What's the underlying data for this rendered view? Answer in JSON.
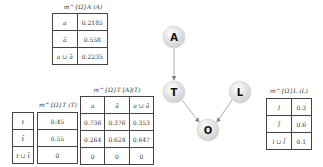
{
  "tables": {
    "mA": {
      "caption": "m^{Ω}A (A)",
      "rows": [
        {
          "label": "a",
          "value": "0.2185"
        },
        {
          "label": "ā",
          "value": "0.558"
        },
        {
          "label": "a ∪ ā",
          "value": "0.2235"
        }
      ]
    },
    "T_labels": [
      "t",
      "t̄",
      "t ∪ t̄"
    ],
    "mT": {
      "caption": "m^{Ω}T (T)",
      "values": [
        "0.45",
        "0.55",
        "0"
      ]
    },
    "mTA": {
      "caption": "m^{Ω}T [A](T)",
      "headers": [
        "a",
        "ā",
        "a ∪ ā"
      ],
      "rows": [
        [
          "0.736",
          "0.376",
          "0.353"
        ],
        [
          "0.264",
          "0.624",
          "0.647"
        ],
        [
          "0",
          "0",
          "0"
        ]
      ]
    },
    "mL": {
      "caption": "m^{Ω}L (L)",
      "rows": [
        {
          "label": "l",
          "value": "0.3"
        },
        {
          "label": "l̄",
          "value": "0.6"
        },
        {
          "label": "l ∪ l̄",
          "value": "0.1"
        }
      ]
    }
  },
  "graph": {
    "nodes": [
      {
        "id": "A",
        "label": "A",
        "x": 174,
        "y": 37
      },
      {
        "id": "T",
        "label": "T",
        "x": 174,
        "y": 92
      },
      {
        "id": "L",
        "label": "L",
        "x": 240,
        "y": 92
      },
      {
        "id": "O",
        "label": "O",
        "x": 208,
        "y": 130
      }
    ],
    "edges": [
      [
        "A",
        "T"
      ],
      [
        "T",
        "O"
      ],
      [
        "L",
        "O"
      ]
    ]
  }
}
